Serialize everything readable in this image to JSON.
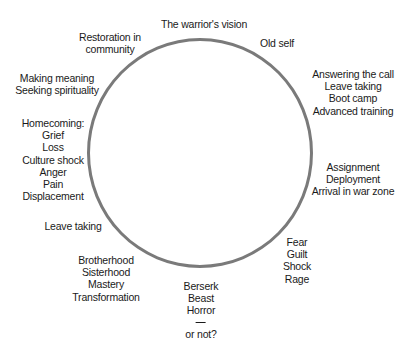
{
  "diagram": {
    "type": "cycle",
    "shape": "circle",
    "stroke_color": "#7a7a7a",
    "text_color": "#1a1a1a",
    "stages": [
      {
        "id": "warriors-vision",
        "lines": [
          "The warrior's vision"
        ]
      },
      {
        "id": "old-self",
        "lines": [
          "Old self"
        ]
      },
      {
        "id": "answering-call",
        "lines": [
          "Answering the call",
          "Leave taking",
          "Boot camp",
          "Advanced training"
        ]
      },
      {
        "id": "assignment",
        "lines": [
          "Assignment",
          "Deployment",
          "Arrival in war zone"
        ]
      },
      {
        "id": "fear",
        "lines": [
          "Fear",
          "Guilt",
          "Shock",
          "Rage"
        ]
      },
      {
        "id": "berserk",
        "lines": [
          "Berserk",
          "Beast",
          "Horror"
        ],
        "separator": "—",
        "after_separator": "or not?"
      },
      {
        "id": "brotherhood",
        "lines": [
          "Brotherhood",
          "Sisterhood",
          "Mastery",
          "Transformation"
        ]
      },
      {
        "id": "leave-taking",
        "lines": [
          "Leave taking"
        ]
      },
      {
        "id": "homecoming",
        "lines": [
          "Homecoming:",
          "Grief",
          "Loss",
          "Culture shock",
          "Anger",
          "Pain",
          "Displacement"
        ]
      },
      {
        "id": "making-meaning",
        "lines": [
          "Making meaning",
          "Seeking spirituality"
        ]
      },
      {
        "id": "restoration",
        "lines": [
          "Restoration in",
          "community"
        ]
      }
    ]
  }
}
